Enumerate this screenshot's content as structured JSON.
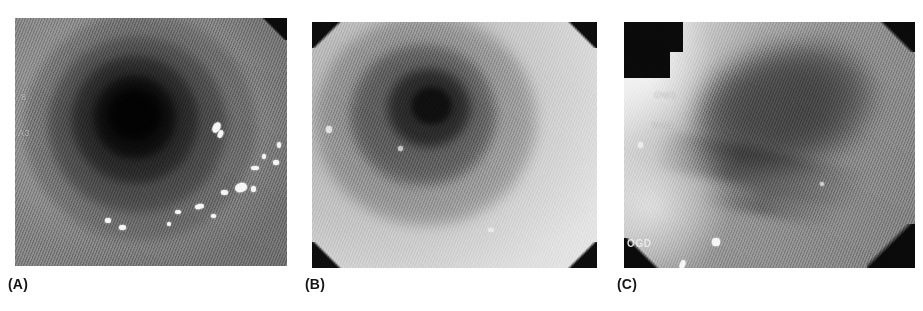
{
  "figure": {
    "background_color": "#ffffff",
    "modality": "endoscopy",
    "color_mode": "grayscale"
  },
  "panels": [
    {
      "id": "A",
      "caption": "(A)",
      "description": "Endoscopic view of oesophagus showing concentric mucosal rings converging on a dark central lumen",
      "overlay_lines": [
        "8",
        "A3"
      ],
      "corner_vignettes": [
        "top-right"
      ],
      "tone": "mid-grey",
      "specular_highlights": 14
    },
    {
      "id": "B",
      "caption": "(B)",
      "description": "Brighter endoscopic view of oesophageal lumen with eccentric dark opening and smooth mucosa",
      "overlay_lines": [],
      "corner_vignettes": [
        "top-left",
        "top-right",
        "bottom-left",
        "bottom-right"
      ],
      "tone": "light-grey",
      "specular_highlights": 3
    },
    {
      "id": "C",
      "caption": "(C)",
      "description": "Oblique endoscopic view with diagonal illumination gradient, dark mucosal shadow and longitudinal fold",
      "overlay_lines": [
        "OW1",
        "WA3",
        "OGD"
      ],
      "corner_vignettes": [
        "top-left-block",
        "top-right",
        "bottom-left",
        "bottom-right"
      ],
      "tone": "gradient-light-to-dark",
      "specular_highlights": 4
    }
  ],
  "captions": {
    "a": "(A)",
    "b": "(B)",
    "c": "(C)"
  },
  "overlays": {
    "a_line1": "8",
    "a_line2": "A3",
    "c_line1": "OW1",
    "c_line2": "WA3",
    "c_line3": "OGD"
  }
}
